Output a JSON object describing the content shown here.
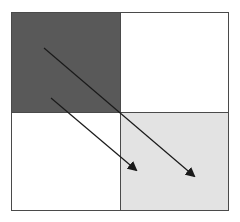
{
  "diagram": {
    "type": "2x2-grid-with-arrows",
    "frame": {
      "x": 11,
      "y": 12,
      "width": 218,
      "height": 199,
      "border_color": "#4a4a4a"
    },
    "cells": [
      {
        "id": "top-left",
        "x": 11,
        "y": 12,
        "width": 109,
        "height": 100,
        "fill": "#595959"
      },
      {
        "id": "top-right",
        "x": 120,
        "y": 12,
        "width": 109,
        "height": 100,
        "fill": "#ffffff"
      },
      {
        "id": "bottom-left",
        "x": 11,
        "y": 112,
        "width": 109,
        "height": 99,
        "fill": "#ffffff"
      },
      {
        "id": "bottom-right",
        "x": 120,
        "y": 112,
        "width": 109,
        "height": 99,
        "fill": "#e3e3e3"
      }
    ],
    "arrows": [
      {
        "id": "arrow-long",
        "x1": 44,
        "y1": 48,
        "x2": 194,
        "y2": 176,
        "color": "#1a1a1a"
      },
      {
        "id": "arrow-short",
        "x1": 51,
        "y1": 98,
        "x2": 136,
        "y2": 170,
        "color": "#1a1a1a"
      }
    ]
  }
}
